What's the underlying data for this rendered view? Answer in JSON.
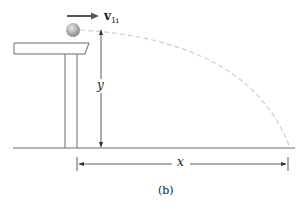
{
  "figure": {
    "velocity_label": "v",
    "velocity_subscript": "1i",
    "height_label": "y",
    "distance_label": "x",
    "caption": "(b)"
  },
  "colors": {
    "line": "#6b6b6b",
    "trajectory": "#cfcfcf",
    "ball": "#9a9a9a",
    "arrow": "#555555"
  }
}
